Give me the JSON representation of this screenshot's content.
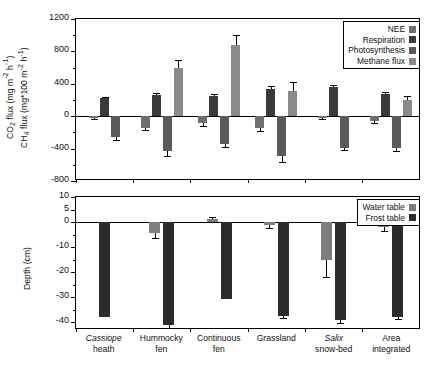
{
  "chart_data": {
    "type": "bar",
    "title": "",
    "categories": [
      "Cassiope heath",
      "Hummocky fen",
      "Continuous fen",
      "Grassland",
      "Salix snow-bed",
      "Area integrated"
    ],
    "category_lines": [
      {
        "l1": "Cassiope",
        "l2": "heath",
        "italic1": true
      },
      {
        "l1": "Hummocky",
        "l2": "fen",
        "italic1": false
      },
      {
        "l1": "Continuous",
        "l2": "fen",
        "italic1": false
      },
      {
        "l1": "Grassland",
        "l2": "",
        "italic1": false
      },
      {
        "l1": "Salix",
        "l2": "snow-bed",
        "italic1": true
      },
      {
        "l1": "Area",
        "l2": "integrated",
        "italic1": false
      }
    ],
    "panels": [
      {
        "id": "top",
        "ylabel_lines": [
          "CO2 flux (mg m-2 h-1)",
          "CH4 flux (mg*100 m-2 h-1)"
        ],
        "ylim": [
          -800,
          1200
        ],
        "yticks": [
          1200,
          800,
          400,
          0,
          -400,
          -800
        ],
        "yticks_minor": [
          1000,
          600,
          200,
          -200,
          -600
        ],
        "grid": false,
        "legend_position": "top-right",
        "series": [
          {
            "name": "NEE",
            "color": "#6f6f6f",
            "values": [
              -25,
              -145,
              -80,
              -150,
              -25,
              -60
            ],
            "errors": [
              12,
              30,
              38,
              38,
              14,
              28
            ]
          },
          {
            "name": "Respiration",
            "color": "#3a3a3a",
            "values": [
              220,
              265,
              255,
              330,
              360,
              270
            ],
            "errors": [
              22,
              20,
              20,
              45,
              30,
              30
            ]
          },
          {
            "name": "Photosynthesis",
            "color": "#5a5a5a",
            "values": [
              -255,
              -435,
              -340,
              -490,
              -395,
              -390
            ],
            "errors": [
              35,
              55,
              45,
              80,
              25,
              45
            ]
          },
          {
            "name": "Methane flux",
            "color": "#8a8a8a",
            "values": [
              null,
              595,
              880,
              310,
              null,
              195
            ],
            "errors": [
              null,
              105,
              125,
              110,
              null,
              55
            ]
          }
        ]
      },
      {
        "id": "bottom",
        "ylabel_lines": [
          "Depth (cm)"
        ],
        "ylim": [
          -43,
          10
        ],
        "yticks": [
          10,
          5,
          0,
          -10,
          -20,
          -30,
          -40
        ],
        "yticks_minor": [
          -5,
          -15,
          -25,
          -35
        ],
        "grid": false,
        "legend_position": "top-right",
        "series": [
          {
            "name": "Water table",
            "color": "#7d7d7d",
            "values": [
              null,
              -4.2,
              1.2,
              -1.0,
              -15.0,
              -2.0
            ],
            "errors": [
              null,
              2.2,
              0.8,
              1.3,
              7.0,
              1.6
            ]
          },
          {
            "name": "Frost table",
            "color": "#2b2b2b",
            "values": [
              -38.0,
              -41.0,
              -30.5,
              -37.5,
              -39.0,
              -37.8
            ],
            "errors": [
              0,
              1.2,
              0,
              0.9,
              1.1,
              0.8
            ]
          }
        ]
      }
    ]
  },
  "top_panel": {
    "axis_title_line1": "CO",
    "axis_title_line1_sub": "2",
    "axis_title_line1_rest": " flux (mg m",
    "axis_title_line1_sup": "-2",
    "axis_title_line1_tail": " h",
    "axis_title_line1_sup2": "-1",
    "axis_title_line1_end": ")",
    "axis_title_line2": "CH",
    "axis_title_line2_sub": "4",
    "axis_title_line2_rest": " flux (mg*100 m",
    "axis_title_line2_sup": "-2",
    "axis_title_line2_tail": " h",
    "axis_title_line2_sup2": "-1",
    "axis_title_line2_end": ")",
    "ytick_labels": [
      "1200",
      "800",
      "400",
      "0",
      "-400",
      "-800"
    ],
    "legend": [
      {
        "label": "NEE",
        "color": "#6f6f6f"
      },
      {
        "label": "Respiration",
        "color": "#3a3a3a"
      },
      {
        "label": "Photosynthesis",
        "color": "#5a5a5a"
      },
      {
        "label": "Methane flux",
        "color": "#8a8a8a"
      }
    ]
  },
  "bottom_panel": {
    "axis_title": "Depth (cm)",
    "ytick_labels": [
      "10",
      "5",
      "0",
      "-10",
      "-20",
      "-30",
      "-40"
    ],
    "legend": [
      {
        "label": "Water table",
        "color": "#7d7d7d"
      },
      {
        "label": "Frost table",
        "color": "#2b2b2b"
      }
    ]
  }
}
